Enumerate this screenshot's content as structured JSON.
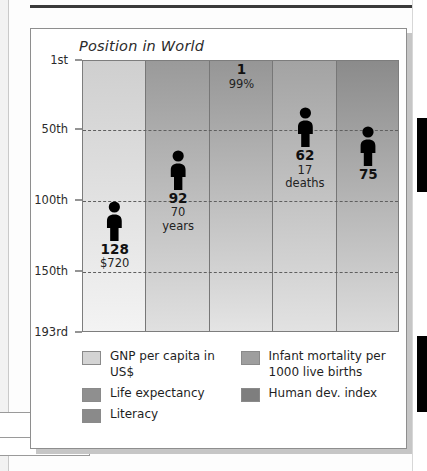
{
  "chart_data": {
    "type": "bar",
    "title": "Position in World",
    "xlabel": "",
    "ylabel": "Position in World",
    "grid": true,
    "legend_position": "bottom",
    "y_axis": {
      "ticks": [
        "1st",
        "50th",
        "100th",
        "150th",
        "193rd"
      ],
      "tick_values": [
        1,
        50,
        100,
        150,
        193
      ],
      "inverted": true,
      "ylim": [
        1,
        193
      ]
    },
    "categories": [
      "GNP per capita in US$",
      "Life expectancy",
      "Literacy",
      "Infant mortality per 1000 live births",
      "Human dev. index"
    ],
    "values": [
      128,
      92,
      1,
      62,
      75
    ],
    "annotations": [
      "$720",
      "70\nyears",
      "99%",
      "17\ndeaths",
      ""
    ],
    "points": [
      {
        "category": "GNP per capita in US$",
        "rank": 128,
        "rank_label": "128",
        "value_label": "$720",
        "swatch": "#d8d8d8"
      },
      {
        "category": "Life expectancy",
        "rank": 92,
        "rank_label": "92",
        "value_label": "70\nyears",
        "swatch": "#a0a0a0"
      },
      {
        "category": "Literacy",
        "rank": 1,
        "rank_label": "1",
        "value_label": "99%",
        "swatch": "#9a9a9a"
      },
      {
        "category": "Infant mortality per 1000 live births",
        "rank": 62,
        "rank_label": "62",
        "value_label": "17\ndeaths",
        "swatch": "#a8a8a8"
      },
      {
        "category": "Human dev. index",
        "rank": 75,
        "rank_label": "75",
        "value_label": "",
        "swatch": "#8e8e8e"
      }
    ]
  },
  "legend": {
    "left": [
      {
        "label": "GNP per capita in US$",
        "color": "#d4d4d4"
      },
      {
        "label": "Life expectancy",
        "color": "#8f8f8f"
      },
      {
        "label": "Literacy",
        "color": "#8a8a8a"
      }
    ],
    "right": [
      {
        "label": "Infant mortality per\n1000 live births",
        "color": "#9e9e9e"
      },
      {
        "label": "Human dev. index",
        "color": "#7e7e7e"
      }
    ]
  }
}
